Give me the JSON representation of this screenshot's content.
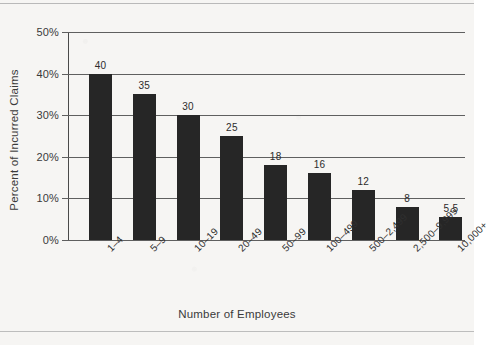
{
  "chart_data": {
    "type": "bar",
    "title": "",
    "xlabel": "Number of Employees",
    "ylabel": "Percent of Incurred Claims",
    "categories": [
      "1–4",
      "5–9",
      "10–19",
      "20–49",
      "50–99",
      "100–499",
      "500–2,499",
      "2,500–9,999",
      "10,000+"
    ],
    "values": [
      40,
      35,
      30,
      25,
      18,
      16,
      12,
      8,
      5.5
    ],
    "data_labels": [
      "40",
      "35",
      "30",
      "25",
      "18",
      "16",
      "12",
      "8",
      "5.5"
    ],
    "ylim": [
      0,
      50
    ],
    "yticks": [
      0,
      10,
      20,
      30,
      40,
      50
    ],
    "ytick_labels": [
      "0%",
      "10%",
      "20%",
      "30%",
      "40%",
      "50%"
    ],
    "grid": true,
    "legend": "none",
    "bar_color": "#262626",
    "grid_color": "#5f5f5f",
    "axis_color": "#4a4a4a",
    "background_color": "#f6f5f3"
  }
}
